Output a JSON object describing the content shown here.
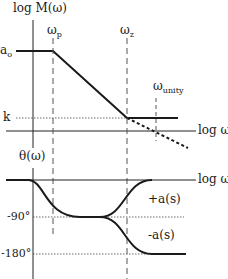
{
  "magnitude_plot": {
    "y_axis_label": "log M(ω)",
    "x_axis_label": "log ω",
    "levels": {
      "high": "a",
      "high_sub": "o",
      "low": "k"
    },
    "frequencies": [
      {
        "symbol": "ω",
        "sub": "p"
      },
      {
        "symbol": "ω",
        "sub": "z"
      },
      {
        "symbol": "ω",
        "sub": "unity"
      }
    ]
  },
  "phase_plot": {
    "y_axis_label": "θ(ω)",
    "x_axis_label": "log ω",
    "ticks": [
      "-90°",
      "-180°"
    ],
    "curves": [
      {
        "label": "+a(s)"
      },
      {
        "label": "-a(s)"
      }
    ]
  },
  "colors": {
    "line": "#1a1a1a",
    "dashed": "#555555"
  }
}
